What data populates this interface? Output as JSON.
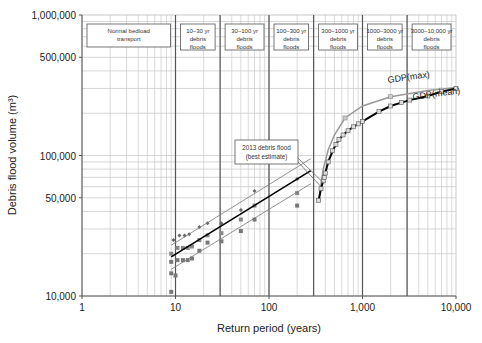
{
  "chart_data": {
    "type": "scatter",
    "title": "",
    "xlabel": "Return period (years)",
    "ylabel": "Debris flood volume (m³)",
    "xscale": "log",
    "yscale": "log",
    "xlim": [
      1,
      10000
    ],
    "ylim": [
      10000,
      1000000
    ],
    "grid": true,
    "x_ticks": [
      {
        "value": 1,
        "label": "1"
      },
      {
        "value": 10,
        "label": "10"
      },
      {
        "value": 100,
        "label": "100"
      },
      {
        "value": 1000,
        "label": "1,000"
      },
      {
        "value": 10000,
        "label": "10,000"
      }
    ],
    "y_ticks": [
      {
        "value": 10000,
        "label": "10,000"
      },
      {
        "value": 50000,
        "label": "50,000"
      },
      {
        "value": 100000,
        "label": "100,000"
      },
      {
        "value": 500000,
        "label": "500,000"
      },
      {
        "value": 1000000,
        "label": "1,000,000"
      }
    ],
    "class_boundaries": [
      10,
      30,
      100,
      300,
      1000,
      3000
    ],
    "class_labels": [
      {
        "lines": [
          "Normal bedload",
          "transport"
        ],
        "x_from": 1,
        "x_to": 10
      },
      {
        "lines": [
          "10–30 yr",
          "debris",
          "floods"
        ],
        "x_from": 10,
        "x_to": 30
      },
      {
        "lines": [
          "30–100 yr",
          "debris",
          "floods"
        ],
        "x_from": 30,
        "x_to": 100
      },
      {
        "lines": [
          "100–300 yr",
          "debris",
          "floods"
        ],
        "x_from": 100,
        "x_to": 300
      },
      {
        "lines": [
          "300–1000 yr",
          "debris",
          "floods"
        ],
        "x_from": 300,
        "x_to": 1000
      },
      {
        "lines": [
          "1000–3000 yr",
          "debris",
          "floods"
        ],
        "x_from": 1000,
        "x_to": 3000
      },
      {
        "lines": [
          "3000–10,000 yr",
          "debris",
          "floods"
        ],
        "x_from": 3000,
        "x_to": 10000
      }
    ],
    "annotation": {
      "lines": [
        "2013 debris flood",
        "(best estimate)"
      ],
      "points_to": {
        "x": 380,
        "y": 78000
      }
    },
    "series": [
      {
        "name": "Upper envelope data",
        "marker": "diamond",
        "color": "#666666",
        "points": [
          {
            "x": 9.5,
            "y": 25000
          },
          {
            "x": 11,
            "y": 27000
          },
          {
            "x": 12.5,
            "y": 27000
          },
          {
            "x": 14,
            "y": 27500
          },
          {
            "x": 18,
            "y": 31000
          },
          {
            "x": 22,
            "y": 33000
          },
          {
            "x": 31,
            "y": 33000
          },
          {
            "x": 50,
            "y": 41000
          },
          {
            "x": 70,
            "y": 56000
          },
          {
            "x": 200,
            "y": 68000
          }
        ]
      },
      {
        "name": "Mean data",
        "marker": "square",
        "color": "#888888",
        "points": [
          {
            "x": 9,
            "y": 20000
          },
          {
            "x": 10.5,
            "y": 22000
          },
          {
            "x": 12,
            "y": 22000
          },
          {
            "x": 13.5,
            "y": 22000
          },
          {
            "x": 15,
            "y": 22500
          },
          {
            "x": 18,
            "y": 25000
          },
          {
            "x": 22,
            "y": 27000
          },
          {
            "x": 31,
            "y": 28000
          },
          {
            "x": 50,
            "y": 35000
          },
          {
            "x": 70,
            "y": 44000
          },
          {
            "x": 200,
            "y": 54000
          }
        ]
      },
      {
        "name": "Lower envelope data",
        "marker": "square",
        "color": "#777777",
        "points": [
          {
            "x": 9,
            "y": 17500
          },
          {
            "x": 10.5,
            "y": 18000
          },
          {
            "x": 12,
            "y": 18000
          },
          {
            "x": 13.5,
            "y": 18000
          },
          {
            "x": 15,
            "y": 18500
          },
          {
            "x": 18,
            "y": 21000
          },
          {
            "x": 22,
            "y": 24000
          },
          {
            "x": 31,
            "y": 24500
          },
          {
            "x": 50,
            "y": 29000
          },
          {
            "x": 70,
            "y": 35000
          },
          {
            "x": 200,
            "y": 44000
          },
          {
            "x": 9,
            "y": 14500
          },
          {
            "x": 10,
            "y": 14000
          },
          {
            "x": 9,
            "y": 10700
          }
        ]
      },
      {
        "name": "GDP(max)",
        "type": "line",
        "color": "#999999",
        "label": "GDP(max)",
        "points": [
          {
            "x": 340,
            "y": 48000
          },
          {
            "x": 380,
            "y": 80000
          },
          {
            "x": 430,
            "y": 110000
          },
          {
            "x": 500,
            "y": 140000
          },
          {
            "x": 650,
            "y": 185000
          },
          {
            "x": 1000,
            "y": 225000
          },
          {
            "x": 2000,
            "y": 262000
          },
          {
            "x": 5000,
            "y": 290000
          },
          {
            "x": 10000,
            "y": 305000
          }
        ]
      },
      {
        "name": "GDP(mean)",
        "type": "line",
        "color": "#000000",
        "label": "GDP(mean)",
        "marker": "square",
        "points": [
          {
            "x": 340,
            "y": 48000
          },
          {
            "x": 360,
            "y": 58000
          },
          {
            "x": 380,
            "y": 66000
          },
          {
            "x": 390,
            "y": 70000
          },
          {
            "x": 400,
            "y": 75000
          },
          {
            "x": 430,
            "y": 90000
          },
          {
            "x": 480,
            "y": 108000
          },
          {
            "x": 520,
            "y": 120000
          },
          {
            "x": 560,
            "y": 130000
          },
          {
            "x": 620,
            "y": 140000
          },
          {
            "x": 700,
            "y": 150000
          },
          {
            "x": 800,
            "y": 160000
          },
          {
            "x": 900,
            "y": 168000
          },
          {
            "x": 1000,
            "y": 175000
          },
          {
            "x": 1500,
            "y": 205000
          },
          {
            "x": 2000,
            "y": 225000
          },
          {
            "x": 2600,
            "y": 238000
          },
          {
            "x": 3200,
            "y": 248000
          },
          {
            "x": 5000,
            "y": 265000
          },
          {
            "x": 7000,
            "y": 285000
          },
          {
            "x": 10000,
            "y": 300000
          }
        ]
      },
      {
        "name": "Mean regression",
        "type": "line",
        "color": "#000000",
        "points": [
          {
            "x": 9,
            "y": 19000
          },
          {
            "x": 280,
            "y": 78000
          }
        ]
      },
      {
        "name": "Upper confidence",
        "type": "line",
        "color": "#777777",
        "points": [
          {
            "x": 9,
            "y": 23000
          },
          {
            "x": 280,
            "y": 95000
          }
        ]
      },
      {
        "name": "Lower confidence",
        "type": "line",
        "color": "#777777",
        "points": [
          {
            "x": 9,
            "y": 15500
          },
          {
            "x": 280,
            "y": 63000
          }
        ]
      }
    ]
  }
}
